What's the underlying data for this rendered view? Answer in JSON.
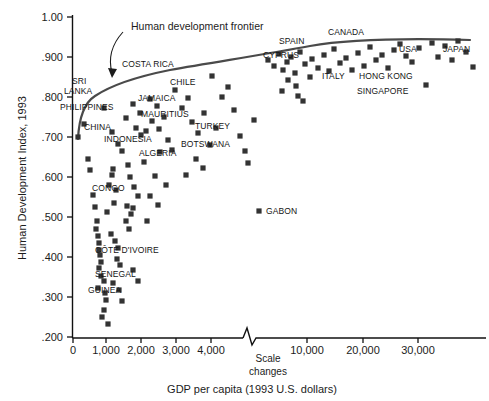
{
  "chart_data": {
    "type": "scatter",
    "title": "",
    "xlabel": "GDP per capita (1993 U.S. dollars)",
    "ylabel": "Human Development Index, 1993",
    "xticks": [
      "0",
      "1,000",
      "2,000",
      "3,000",
      "4,000",
      "10,000",
      "20,000",
      "30,000"
    ],
    "yticks": [
      ".200",
      ".300",
      ".400",
      ".500",
      ".600",
      ".700",
      ".800",
      ".900",
      "1.00"
    ],
    "ylim": [
      0.2,
      1.0
    ],
    "grid": false,
    "legend": null,
    "axis_break_note": [
      "Scale",
      "changes"
    ],
    "annotations": [
      {
        "text": "Human development frontier",
        "kind": "curve-callout"
      }
    ],
    "curve_name": "Human development frontier",
    "labeled_points": [
      {
        "name": "SRI LANKA",
        "gdp": 1100,
        "hdi": 0.804
      },
      {
        "name": "PHILIPPINES",
        "gdp": 1500,
        "hdi": 0.777
      },
      {
        "name": "CHINA",
        "gdp": 1400,
        "hdi": 0.732
      },
      {
        "name": "INDONESIA",
        "gdp": 2200,
        "hdi": 0.702
      },
      {
        "name": "COSTA RICA",
        "gdp": 3200,
        "hdi": 0.862
      },
      {
        "name": "JAMAICA",
        "gdp": 2800,
        "hdi": 0.805
      },
      {
        "name": "CHILE",
        "gdp": 6000,
        "hdi": 0.848
      },
      {
        "name": "MAURITIUS",
        "gdp": 6500,
        "hdi": 0.778
      },
      {
        "name": "TURKEY",
        "gdp": 6700,
        "hdi": 0.729
      },
      {
        "name": "BOTSWANA",
        "gdp": 5900,
        "hdi": 0.7
      },
      {
        "name": "ALGERIA",
        "gdp": 3200,
        "hdi": 0.67
      },
      {
        "name": "CONGO",
        "gdp": 1300,
        "hdi": 0.547
      },
      {
        "name": "GABON",
        "gdp": 5500,
        "hdi": 0.525
      },
      {
        "name": "CÔTE D'IVOIRE",
        "gdp": 1000,
        "hdi": 0.42
      },
      {
        "name": "SENEGAL",
        "gdp": 1200,
        "hdi": 0.37
      },
      {
        "name": "GUINEA",
        "gdp": 900,
        "hdi": 0.34
      },
      {
        "name": "CYPRUS",
        "gdp": 11000,
        "hdi": 0.89
      },
      {
        "name": "SPAIN",
        "gdp": 13000,
        "hdi": 0.933
      },
      {
        "name": "CANADA",
        "gdp": 19000,
        "hdi": 0.951
      },
      {
        "name": "ITALY",
        "gdp": 17000,
        "hdi": 0.912
      },
      {
        "name": "HONG KONG",
        "gdp": 20000,
        "hdi": 0.909
      },
      {
        "name": "SINGAPORE",
        "gdp": 20000,
        "hdi": 0.881
      },
      {
        "name": "USA",
        "gdp": 23000,
        "hdi": 0.94
      },
      {
        "name": "JAPAN",
        "gdp": 31000,
        "hdi": 0.938
      }
    ],
    "points_px": [
      [
        78,
        137
      ],
      [
        84,
        124
      ],
      [
        88,
        159
      ],
      [
        90,
        170
      ],
      [
        93,
        195
      ],
      [
        95,
        207
      ],
      [
        97,
        221
      ],
      [
        96,
        229
      ],
      [
        98,
        236
      ],
      [
        99,
        243
      ],
      [
        99,
        250
      ],
      [
        100,
        255
      ],
      [
        101,
        262
      ],
      [
        99,
        268
      ],
      [
        101,
        276
      ],
      [
        104,
        281
      ],
      [
        98,
        288
      ],
      [
        105,
        293
      ],
      [
        106,
        300
      ],
      [
        104,
        310
      ],
      [
        102,
        317
      ],
      [
        108,
        324
      ],
      [
        107,
        212
      ],
      [
        109,
        185
      ],
      [
        112,
        175
      ],
      [
        113,
        169
      ],
      [
        114,
        203
      ],
      [
        116,
        190
      ],
      [
        111,
        234
      ],
      [
        115,
        241
      ],
      [
        118,
        248
      ],
      [
        117,
        259
      ],
      [
        120,
        265
      ],
      [
        113,
        283
      ],
      [
        119,
        290
      ],
      [
        122,
        301
      ],
      [
        104,
        108
      ],
      [
        112,
        132
      ],
      [
        118,
        144
      ],
      [
        122,
        151
      ],
      [
        126,
        118
      ],
      [
        133,
        104
      ],
      [
        140,
        113
      ],
      [
        136,
        128
      ],
      [
        141,
        135
      ],
      [
        128,
        165
      ],
      [
        130,
        177
      ],
      [
        134,
        187
      ],
      [
        138,
        196
      ],
      [
        127,
        206
      ],
      [
        131,
        214
      ],
      [
        126,
        221
      ],
      [
        129,
        229
      ],
      [
        133,
        270
      ],
      [
        138,
        281
      ],
      [
        133,
        208
      ],
      [
        144,
        162
      ],
      [
        150,
        99
      ],
      [
        157,
        106
      ],
      [
        152,
        121
      ],
      [
        146,
        131
      ],
      [
        159,
        129
      ],
      [
        164,
        117
      ],
      [
        168,
        140
      ],
      [
        172,
        150
      ],
      [
        160,
        152
      ],
      [
        155,
        176
      ],
      [
        166,
        185
      ],
      [
        150,
        196
      ],
      [
        158,
        205
      ],
      [
        147,
        221
      ],
      [
        175,
        90
      ],
      [
        182,
        108
      ],
      [
        188,
        98
      ],
      [
        192,
        122
      ],
      [
        198,
        133
      ],
      [
        204,
        113
      ],
      [
        210,
        145
      ],
      [
        196,
        159
      ],
      [
        203,
        168
      ],
      [
        186,
        175
      ],
      [
        216,
        128
      ],
      [
        222,
        97
      ],
      [
        228,
        87
      ],
      [
        212,
        76
      ],
      [
        234,
        110
      ],
      [
        240,
        136
      ],
      [
        248,
        163
      ],
      [
        259,
        211
      ],
      [
        245,
        151
      ],
      [
        254,
        120
      ],
      [
        268,
        60
      ],
      [
        274,
        66
      ],
      [
        279,
        54
      ],
      [
        283,
        70
      ],
      [
        287,
        62
      ],
      [
        291,
        57
      ],
      [
        295,
        73
      ],
      [
        288,
        80
      ],
      [
        296,
        86
      ],
      [
        282,
        91
      ],
      [
        300,
        52
      ],
      [
        305,
        64
      ],
      [
        310,
        77
      ],
      [
        298,
        96
      ],
      [
        303,
        101
      ],
      [
        312,
        59
      ],
      [
        318,
        68
      ],
      [
        324,
        55
      ],
      [
        329,
        71
      ],
      [
        334,
        49
      ],
      [
        340,
        63
      ],
      [
        346,
        58
      ],
      [
        352,
        70
      ],
      [
        358,
        53
      ],
      [
        364,
        66
      ],
      [
        370,
        47
      ],
      [
        376,
        60
      ],
      [
        382,
        55
      ],
      [
        388,
        68
      ],
      [
        394,
        50
      ],
      [
        400,
        44
      ],
      [
        406,
        56
      ],
      [
        412,
        62
      ],
      [
        419,
        48
      ],
      [
        426,
        85
      ],
      [
        432,
        43
      ],
      [
        438,
        57
      ],
      [
        445,
        46
      ],
      [
        452,
        60
      ],
      [
        458,
        41
      ],
      [
        466,
        52
      ],
      [
        473,
        67
      ]
    ]
  },
  "labels_px": [
    {
      "text": "SRI",
      "x": 72,
      "y": 84,
      "anchor": "start"
    },
    {
      "text": "LANKA",
      "x": 64,
      "y": 94,
      "anchor": "start"
    },
    {
      "text": "PHILIPPINES",
      "x": 60,
      "y": 110,
      "anchor": "start"
    },
    {
      "text": "CHINA",
      "x": 84,
      "y": 130,
      "anchor": "start"
    },
    {
      "text": "INDONESIA",
      "x": 104,
      "y": 142,
      "anchor": "start"
    },
    {
      "text": "COSTA RICA",
      "x": 122,
      "y": 67,
      "anchor": "start"
    },
    {
      "text": "JAMAICA",
      "x": 138,
      "y": 101,
      "anchor": "start"
    },
    {
      "text": "CHILE",
      "x": 170,
      "y": 85,
      "anchor": "start"
    },
    {
      "text": "MAURITIUS",
      "x": 141,
      "y": 117,
      "anchor": "start"
    },
    {
      "text": "TURKEY",
      "x": 195,
      "y": 129,
      "anchor": "start"
    },
    {
      "text": "BOTSWANA",
      "x": 181,
      "y": 147,
      "anchor": "start"
    },
    {
      "text": "ALGERIA",
      "x": 139,
      "y": 156,
      "anchor": "start"
    },
    {
      "text": "CONGO",
      "x": 92,
      "y": 191,
      "anchor": "start"
    },
    {
      "text": "GABON",
      "x": 266,
      "y": 214,
      "anchor": "start"
    },
    {
      "text": "CÔTE D'IVOIRE",
      "x": 95,
      "y": 253,
      "anchor": "start"
    },
    {
      "text": "SENEGAL",
      "x": 95,
      "y": 277,
      "anchor": "start"
    },
    {
      "text": "GUINEA",
      "x": 88,
      "y": 293,
      "anchor": "start"
    },
    {
      "text": "CYPRUS",
      "x": 263,
      "y": 58,
      "anchor": "start"
    },
    {
      "text": "SPAIN",
      "x": 279,
      "y": 44,
      "anchor": "start"
    },
    {
      "text": "CANADA",
      "x": 328,
      "y": 35,
      "anchor": "start"
    },
    {
      "text": "ITALY",
      "x": 322,
      "y": 79,
      "anchor": "start"
    },
    {
      "text": "HONG KONG",
      "x": 359,
      "y": 79,
      "anchor": "start"
    },
    {
      "text": "SINGAPORE",
      "x": 357,
      "y": 94,
      "anchor": "start"
    },
    {
      "text": "USA",
      "x": 399,
      "y": 52,
      "anchor": "start"
    },
    {
      "text": "JAPAN",
      "x": 443,
      "y": 52,
      "anchor": "start"
    }
  ],
  "axis": {
    "ytick_px": [
      {
        "label": "1.00",
        "y": 17
      },
      {
        "label": ".900",
        "y": 57
      },
      {
        "label": ".800",
        "y": 97
      },
      {
        "label": ".700",
        "y": 137
      },
      {
        "label": ".600",
        "y": 177
      },
      {
        "label": ".500",
        "y": 217
      },
      {
        "label": ".400",
        "y": 257
      },
      {
        "label": ".300",
        "y": 297
      },
      {
        "label": ".200",
        "y": 337
      }
    ],
    "xtick_px": [
      {
        "label": "0",
        "x": 73
      },
      {
        "label": "1,000",
        "x": 106
      },
      {
        "label": "2,000",
        "x": 141
      },
      {
        "label": "3,000",
        "x": 176
      },
      {
        "label": "4,000",
        "x": 211
      },
      {
        "label": "10,000",
        "x": 307
      },
      {
        "label": "20,000",
        "x": 363
      },
      {
        "label": "30,000",
        "x": 418
      }
    ]
  },
  "text": {
    "y_axis_title": "Human Development Index, 1993",
    "x_axis_title": "GDP per capita (1993 U.S. dollars)",
    "frontier_annotation": "Human development frontier",
    "scale_note_line1": "Scale",
    "scale_note_line2": "changes"
  },
  "colors": {
    "marker": "#333333",
    "axis": "#111111",
    "curve": "#4a4a4a",
    "text": "#1a1a1a",
    "background": "#ffffff"
  }
}
